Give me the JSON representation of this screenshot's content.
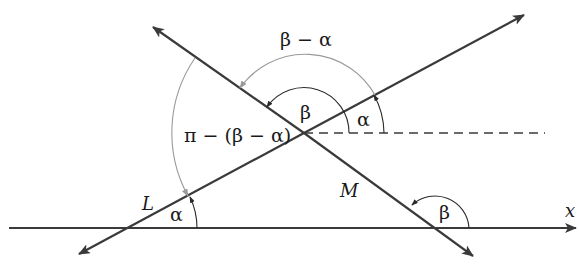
{
  "figure": {
    "width": 579,
    "height": 274,
    "colors": {
      "line": "#3a3a3a",
      "arc_dark": "#2a2a2a",
      "arc_grey": "#9a9a9a",
      "text": "#1a1a1a"
    }
  },
  "labels": {
    "beta_minus_alpha": "β − α",
    "pi_minus": "π − (β − α)",
    "beta_center": "β",
    "alpha_center": "α",
    "line_L": "L",
    "line_M": "M",
    "alpha_axis": "α",
    "beta_axis": "β",
    "x_axis": "x"
  },
  "geometry": {
    "x_axis": {
      "y": 228,
      "x_start": 9,
      "x_end": 576
    },
    "intersection": {
      "x": 304,
      "y": 133
    },
    "line_L": {
      "from": [
        79,
        254
      ],
      "to": [
        524,
        15
      ],
      "x_intercept": 125
    },
    "line_M": {
      "from": [
        153,
        27
      ],
      "to": [
        473,
        256
      ],
      "x_intercept": 435
    },
    "dashed_horizontal": {
      "y": 133,
      "x_start": 304,
      "x_end": 545
    }
  }
}
